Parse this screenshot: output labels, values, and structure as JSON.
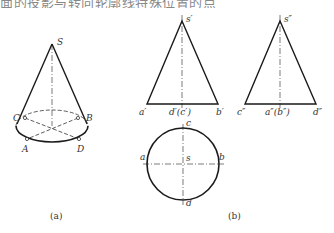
{
  "header": {
    "clipped_text": "面的投影与转向轮廓线特殊位置的点"
  },
  "figure_a": {
    "caption": "(a)",
    "labels": {
      "apex": "S",
      "C": "C",
      "B": "B",
      "A": "A",
      "D": "D"
    }
  },
  "figure_b": {
    "caption": "(b)",
    "front_view": {
      "apex": "s′",
      "left": "a′",
      "center": "d′(c′)",
      "right": "b′"
    },
    "side_view": {
      "apex": "s″",
      "left": "c″",
      "center": "a″(b″)",
      "right": "d″"
    },
    "top_view": {
      "top": "c",
      "left": "a",
      "center": "s",
      "right": "b",
      "bottom": "d"
    }
  },
  "colors": {
    "line": "#1a1a1a",
    "text": "#333333",
    "background": "#ffffff"
  }
}
